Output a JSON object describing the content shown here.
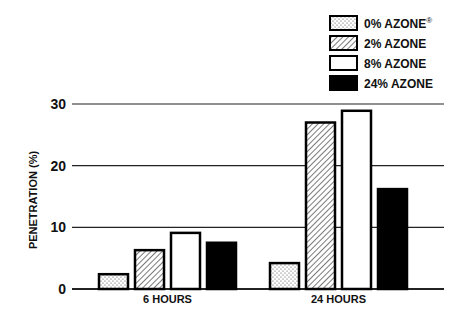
{
  "chart_data": {
    "type": "bar",
    "title": "",
    "xlabel": "",
    "ylabel": "PENETRATION (%)",
    "ylim": [
      0,
      30
    ],
    "yticks": [
      0,
      10,
      20,
      30
    ],
    "grid": true,
    "legend_position": "top-right",
    "categories": [
      "6 HOURS",
      "24 HOURS"
    ],
    "series": [
      {
        "name": "0% AZONE®",
        "pattern": "dots",
        "values": [
          2.4,
          4.2
        ]
      },
      {
        "name": "2% AZONE",
        "pattern": "hatch",
        "values": [
          6.3,
          27.0
        ]
      },
      {
        "name": "8% AZONE",
        "pattern": "white",
        "values": [
          9.1,
          28.9
        ]
      },
      {
        "name": "24% AZONE",
        "pattern": "black",
        "values": [
          7.5,
          16.2
        ]
      }
    ]
  },
  "legend": {
    "items": [
      {
        "label": "0% AZONE",
        "sup": "®"
      },
      {
        "label": "2% AZONE",
        "sup": ""
      },
      {
        "label": "8% AZONE",
        "sup": ""
      },
      {
        "label": "24% AZONE",
        "sup": ""
      }
    ]
  },
  "axis": {
    "ylabel": "PENETRATION (%)",
    "yticks": [
      "0",
      "10",
      "20",
      "30"
    ],
    "categories": [
      "6 HOURS",
      "24 HOURS"
    ]
  }
}
